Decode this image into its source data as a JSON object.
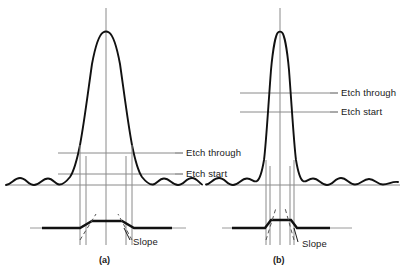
{
  "figure": {
    "type": "diagram",
    "colors": {
      "curve": "#111111",
      "thin_line": "#808080",
      "profile": "#111111",
      "text": "#1a1a1a",
      "background": "#ffffff"
    }
  },
  "panels": [
    {
      "id": "a",
      "caption": "(a)",
      "labels": {
        "etch_through": "Etch through",
        "etch_start": "Etch start",
        "slope": "Slope"
      },
      "geometry": {
        "center_x": 106,
        "peak_y": 32,
        "baseline_y": 185,
        "etch_through_y": 153,
        "etch_start_y": 174,
        "profile_y": 228,
        "profile_top_left": 92,
        "profile_top_right": 122,
        "profile_base_left": 80,
        "profile_base_right": 134,
        "drop_lines_x": [
          80,
          86,
          126,
          132
        ],
        "curve_half_width": 40
      }
    },
    {
      "id": "b",
      "caption": "(b)",
      "labels": {
        "etch_through": "Etch through",
        "etch_start": "Etch start",
        "slope": "Slope"
      },
      "geometry": {
        "center_x": 280,
        "peak_y": 32,
        "baseline_y": 185,
        "etch_through_y": 93,
        "etch_start_y": 112,
        "profile_y": 228,
        "profile_top_left": 271,
        "profile_top_right": 291,
        "profile_base_left": 265,
        "profile_base_right": 297,
        "drop_lines_x": [
          266,
          270,
          290,
          294
        ],
        "curve_half_width": 22
      }
    }
  ]
}
